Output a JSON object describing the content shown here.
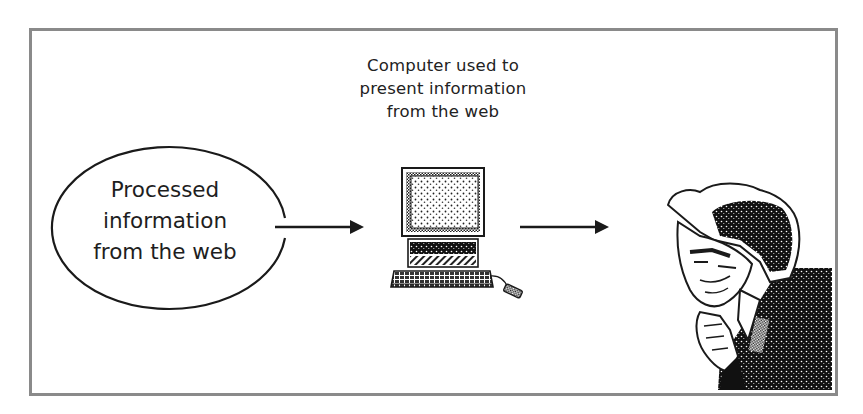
{
  "diagram": {
    "caption": {
      "lines": [
        "Computer used to",
        "present information",
        "from the web"
      ]
    },
    "source_node": {
      "shape": "ellipse",
      "lines": [
        "Processed",
        "information",
        "from the web"
      ]
    },
    "computer_node": {
      "icon": "desktop-computer-icon"
    },
    "viewer_node": {
      "icon": "pensive-person-illustration"
    },
    "arrows": [
      {
        "from": "source_node",
        "to": "computer_node"
      },
      {
        "from": "computer_node",
        "to": "viewer_node"
      }
    ],
    "colors": {
      "frame_border": "#8a8a8a",
      "ink": "#1a1a1a",
      "background": "#ffffff"
    }
  }
}
